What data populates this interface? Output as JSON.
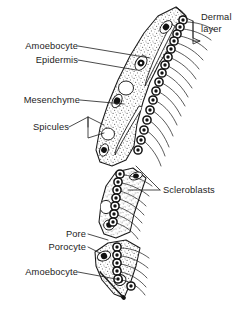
{
  "figure": {
    "colors": {
      "ink": "#1a1a1a",
      "stipple_fill": "#d9d9d9",
      "cell_dark": "#111111",
      "background": "#ffffff",
      "leader_line": "#2a2a2a"
    }
  },
  "labels": {
    "dermal_layer": "Dermal\nlayer",
    "dermal_layer_line1": "Dermal",
    "dermal_layer_line2": "layer",
    "amoebocyte_top": "Amoebocyte",
    "epidermis": "Epidermis",
    "mesenchyme": "Mesenchyme",
    "spicules": "Spicules",
    "scleroblasts": "Scleroblasts",
    "pore": "Pore",
    "porocyte": "Porocyte",
    "amoebocyte_bottom": "Amoebocyte"
  },
  "structures": [
    {
      "name": "dermal-layer",
      "label": "Dermal layer",
      "side": "right",
      "marker": "bracket"
    },
    {
      "name": "amoebocyte-upper",
      "label": "Amoebocyte",
      "side": "left",
      "marker": "leader-line"
    },
    {
      "name": "epidermis",
      "label": "Epidermis",
      "side": "left",
      "marker": "leader-line"
    },
    {
      "name": "mesenchyme",
      "label": "Mesenchyme",
      "side": "left",
      "marker": "leader-line"
    },
    {
      "name": "spicules",
      "label": "Spicules",
      "side": "left",
      "marker": "forked-leader"
    },
    {
      "name": "scleroblasts",
      "label": "Scleroblasts",
      "side": "right",
      "marker": "double-leader"
    },
    {
      "name": "pore",
      "label": "Pore",
      "side": "left",
      "marker": "leader-line"
    },
    {
      "name": "porocyte",
      "label": "Porocyte",
      "side": "left",
      "marker": "leader-line"
    },
    {
      "name": "amoebocyte-lower",
      "label": "Amoebocyte",
      "side": "left",
      "marker": "leader-line"
    }
  ]
}
